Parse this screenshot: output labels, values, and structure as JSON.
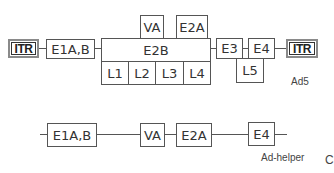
{
  "diagram": {
    "ad5": {
      "label": "Ad5",
      "itr_left": "ITR",
      "itr_right": "ITR",
      "boxes": {
        "e1ab": "E1A,B",
        "va": "VA",
        "e2a": "E2A",
        "e2b": "E2B",
        "l1": "L1",
        "l2": "L2",
        "l3": "L3",
        "l4": "L4",
        "e3": "E3",
        "e4": "E4",
        "l5": "L5"
      }
    },
    "ad_helper": {
      "label": "Ad-helper",
      "boxes": {
        "e1ab": "E1A,B",
        "va": "VA",
        "e2a": "E2A",
        "e4": "E4"
      }
    },
    "panel_letter": "C"
  },
  "colors": {
    "line": "#555555",
    "box_border": "#555555",
    "itr_outer": "#8a8a8a",
    "itr_inner": "#333333",
    "text": "#333333"
  }
}
